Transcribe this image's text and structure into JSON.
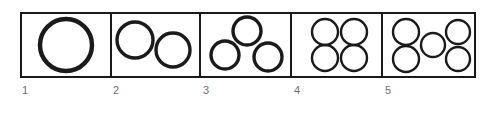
{
  "figure": {
    "background_color": "#ffffff",
    "stroke_color": "#1a1a1a",
    "label_color": "#6d6d6d",
    "frame": {
      "x": 20,
      "y": 12,
      "width": 456,
      "height": 66,
      "border_width": 2
    },
    "divider_x_positions": [
      111,
      200,
      291,
      382
    ],
    "cells": [
      {
        "label": "1",
        "circle_count": 1,
        "label_x": 22,
        "label_y": 85,
        "box": {
          "x": 20,
          "y": 12,
          "width": 91,
          "height": 66
        },
        "circles": [
          {
            "cx": 66,
            "cy": 45,
            "r": 26
          }
        ]
      },
      {
        "label": "2",
        "circle_count": 2,
        "label_x": 113,
        "label_y": 85,
        "box": {
          "x": 111,
          "y": 12,
          "width": 89,
          "height": 66
        },
        "circles": [
          {
            "cx": 135,
            "cy": 40,
            "r": 18
          },
          {
            "cx": 173,
            "cy": 50,
            "r": 17
          }
        ]
      },
      {
        "label": "3",
        "circle_count": 3,
        "label_x": 203,
        "label_y": 85,
        "box": {
          "x": 200,
          "y": 12,
          "width": 91,
          "height": 66
        },
        "circles": [
          {
            "cx": 247,
            "cy": 31,
            "r": 14
          },
          {
            "cx": 225,
            "cy": 55,
            "r": 14
          },
          {
            "cx": 268,
            "cy": 57,
            "r": 14
          }
        ]
      },
      {
        "label": "4",
        "circle_count": 4,
        "label_x": 294,
        "label_y": 85,
        "box": {
          "x": 291,
          "y": 12,
          "width": 91,
          "height": 66
        },
        "circles": [
          {
            "cx": 325,
            "cy": 32,
            "r": 13
          },
          {
            "cx": 354,
            "cy": 32,
            "r": 13
          },
          {
            "cx": 325,
            "cy": 58,
            "r": 13
          },
          {
            "cx": 354,
            "cy": 58,
            "r": 13
          }
        ]
      },
      {
        "label": "5",
        "circle_count": 5,
        "label_x": 385,
        "label_y": 85,
        "box": {
          "x": 382,
          "y": 12,
          "width": 94,
          "height": 66
        },
        "circles": [
          {
            "cx": 406,
            "cy": 32,
            "r": 13
          },
          {
            "cx": 406,
            "cy": 59,
            "r": 13
          },
          {
            "cx": 433,
            "cy": 45,
            "r": 12
          },
          {
            "cx": 458,
            "cy": 32,
            "r": 12
          },
          {
            "cx": 458,
            "cy": 59,
            "r": 12
          }
        ]
      }
    ]
  }
}
